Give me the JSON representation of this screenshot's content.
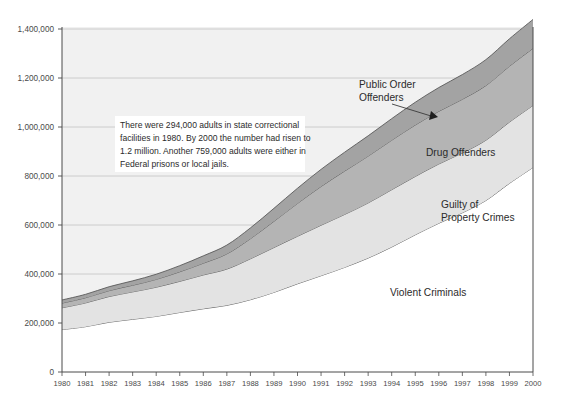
{
  "chart_data": {
    "type": "area",
    "stacked": true,
    "title": "",
    "xlabel": "",
    "ylabel": "",
    "ylim": [
      0,
      1400000
    ],
    "ytick_step": 200000,
    "ytick_labels": [
      "0",
      "200,000",
      "400,000",
      "600,000",
      "800,000",
      "1,000,000",
      "1,200,000",
      "1,400,000"
    ],
    "ytick_values": [
      0,
      200000,
      400000,
      600000,
      800000,
      1000000,
      1200000,
      1400000
    ],
    "grid": true,
    "grid_axis": "y",
    "legend_position": "inline-annotations",
    "categories": [
      1980,
      1981,
      1982,
      1983,
      1984,
      1985,
      1986,
      1987,
      1988,
      1989,
      1990,
      1991,
      1992,
      1993,
      1994,
      1995,
      1996,
      1997,
      1998,
      1999,
      2000
    ],
    "xtick_labels": [
      "1980",
      "1981",
      "1982",
      "1983",
      "1984",
      "1985",
      "1986",
      "1987",
      "1988",
      "1989",
      "1990",
      "1991",
      "1992",
      "1993",
      "1994",
      "1995",
      "1996",
      "1997",
      "1998",
      "1999",
      "2000"
    ],
    "series": [
      {
        "name": "Violent Criminals",
        "color": "#ffffff",
        "values": [
          173000,
          185000,
          203000,
          215000,
          227000,
          243000,
          258000,
          272000,
          295000,
          325000,
          360000,
          393000,
          427000,
          465000,
          510000,
          560000,
          607000,
          650000,
          700000,
          770000,
          835000
        ]
      },
      {
        "name": "Guilty of Property Crimes",
        "color": "#e3e3e3",
        "values": [
          89000,
          97000,
          105000,
          112000,
          119000,
          127000,
          138000,
          148000,
          167000,
          183000,
          194000,
          206000,
          216000,
          225000,
          234000,
          238000,
          242000,
          244000,
          246000,
          250000,
          253000
        ]
      },
      {
        "name": "Drug Offenders",
        "color": "#b4b4b4",
        "values": [
          19000,
          21000,
          24000,
          27000,
          32000,
          39000,
          48000,
          62000,
          82000,
          107000,
          134000,
          158000,
          177000,
          191000,
          202000,
          210000,
          215000,
          219000,
          223000,
          228000,
          233000
        ]
      },
      {
        "name": "Public Order Offenders",
        "color": "#a3a3a3",
        "values": [
          13000,
          14000,
          16000,
          18000,
          21000,
          25000,
          30000,
          36000,
          44000,
          53000,
          62000,
          70000,
          77000,
          83000,
          88000,
          93000,
          97000,
          101000,
          106000,
          112000,
          118000
        ]
      }
    ],
    "totals": [
      294000,
      317000,
      348000,
      372000,
      399000,
      434000,
      474000,
      518000,
      588000,
      668000,
      750000,
      827000,
      897000,
      964000,
      1034000,
      1101000,
      1161000,
      1214000,
      1275000,
      1360000,
      1439000
    ],
    "annotations": [
      {
        "name": "public-order-callout",
        "text_lines": [
          "Public Order",
          "Offenders"
        ],
        "has_leader_line": true,
        "has_arrowhead": true
      },
      {
        "name": "drug-offenders-label",
        "text_lines": [
          "Drug Offenders"
        ],
        "has_leader_line": false,
        "has_arrowhead": false
      },
      {
        "name": "property-crimes-label",
        "text_lines": [
          "Guilty of",
          "Property Crimes"
        ],
        "has_leader_line": false,
        "has_arrowhead": false
      },
      {
        "name": "violent-criminals-label",
        "text_lines": [
          "Violent Criminals"
        ],
        "has_leader_line": false,
        "has_arrowhead": false
      }
    ],
    "callout_box": {
      "lines": [
        "There were 294,000 adults in state correctional",
        "facilities in 1980. By 2000 the number had risen to",
        "1.2 million. Another 759,000 adults were either in",
        "Federal prisons or local jails."
      ],
      "background": "#ffffff"
    }
  },
  "labels": {
    "y": {
      "t0": "0",
      "t1": "200,000",
      "t2": "400,000",
      "t3": "600,000",
      "t4": "800,000",
      "t5": "1,000,000",
      "t6": "1,200,000",
      "t7": "1,400,000"
    },
    "x": {
      "y1980": "1980",
      "y1981": "1981",
      "y1982": "1982",
      "y1983": "1983",
      "y1984": "1984",
      "y1985": "1985",
      "y1986": "1986",
      "y1987": "1987",
      "y1988": "1988",
      "y1989": "1989",
      "y1990": "1990",
      "y1991": "1991",
      "y1992": "1992",
      "y1993": "1993",
      "y1994": "1994",
      "y1995": "1995",
      "y1996": "1996",
      "y1997": "1997",
      "y1998": "1998",
      "y1999": "1999",
      "y2000": "2000"
    },
    "series": {
      "public_order_1": "Public Order",
      "public_order_2": "Offenders",
      "drug": "Drug Offenders",
      "property_1": "Guilty of",
      "property_2": "Property Crimes",
      "violent": "Violent Criminals"
    },
    "callout": {
      "l1": "There were 294,000 adults in state correctional",
      "l2": "facilities in 1980. By 2000 the number had risen to",
      "l3": "1.2 million. Another 759,000 adults were either in",
      "l4": "Federal prisons or local jails."
    }
  },
  "colors": {
    "plot_background": "#f1f1f1",
    "grid_line": "#c4c4c4",
    "axis_line": "#4a4a4a",
    "band_public_order": "#a3a3a3",
    "band_drug": "#b4b4b4",
    "band_property": "#e3e3e3",
    "band_violent": "#ffffff",
    "band_outline": "#5a5a5a"
  }
}
